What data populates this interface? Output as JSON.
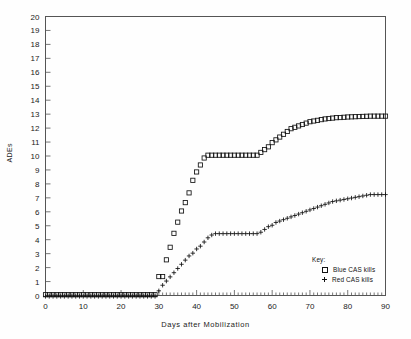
{
  "chart_data": {
    "type": "line",
    "title": "",
    "xlabel": "Days after Mobilization",
    "ylabel": "ADEs",
    "xlim": [
      0,
      90
    ],
    "ylim": [
      0,
      20
    ],
    "xticks": [
      0,
      10,
      20,
      30,
      40,
      50,
      60,
      70,
      80,
      90
    ],
    "yticks": [
      0,
      1,
      2,
      3,
      4,
      5,
      6,
      7,
      8,
      9,
      10,
      11,
      12,
      13,
      14,
      15,
      16,
      17,
      18,
      19,
      20
    ],
    "x_minor_tick_step": 1,
    "y_minor_tick_step": 1,
    "grid": false,
    "legend_position": "inside-lower-right",
    "legend_title": "Key:",
    "x": [
      0,
      1,
      2,
      3,
      4,
      5,
      6,
      7,
      8,
      9,
      10,
      11,
      12,
      13,
      14,
      15,
      16,
      17,
      18,
      19,
      20,
      21,
      22,
      23,
      24,
      25,
      26,
      27,
      28,
      29,
      30,
      31,
      32,
      33,
      34,
      35,
      36,
      37,
      38,
      39,
      40,
      41,
      42,
      43,
      44,
      45,
      46,
      47,
      48,
      49,
      50,
      51,
      52,
      53,
      54,
      55,
      56,
      57,
      58,
      59,
      60,
      61,
      62,
      63,
      64,
      65,
      66,
      67,
      68,
      69,
      70,
      71,
      72,
      73,
      74,
      75,
      76,
      77,
      78,
      79,
      80,
      81,
      82,
      83,
      84,
      85,
      86,
      87,
      88,
      89,
      90
    ],
    "series": [
      {
        "name": "Blue CAS kills",
        "marker": "square",
        "color": "#111111",
        "values": [
          0,
          0,
          0,
          0,
          0,
          0,
          0,
          0,
          0,
          0,
          0,
          0,
          0,
          0,
          0,
          0,
          0,
          0,
          0,
          0,
          0,
          0,
          0,
          0,
          0,
          0,
          0,
          0,
          0,
          0,
          1.3,
          1.3,
          2.5,
          3.4,
          4.4,
          5.2,
          6.0,
          6.6,
          7.3,
          8.2,
          8.8,
          9.3,
          9.8,
          10.0,
          10.0,
          10.0,
          10.0,
          10.0,
          10.0,
          10.0,
          10.0,
          10.0,
          10.0,
          10.0,
          10.0,
          10.0,
          10.0,
          10.2,
          10.4,
          10.6,
          10.9,
          11.1,
          11.3,
          11.5,
          11.7,
          11.9,
          12.0,
          12.1,
          12.2,
          12.3,
          12.4,
          12.45,
          12.5,
          12.55,
          12.6,
          12.63,
          12.66,
          12.69,
          12.7,
          12.72,
          12.74,
          12.75,
          12.76,
          12.77,
          12.78,
          12.79,
          12.8,
          12.8,
          12.8,
          12.8,
          12.8
        ]
      },
      {
        "name": "Red CAS kills",
        "marker": "plus",
        "color": "#111111",
        "values": [
          0,
          0,
          0,
          0,
          0,
          0,
          0,
          0,
          0,
          0,
          0,
          0,
          0,
          0,
          0,
          0,
          0,
          0,
          0,
          0,
          0,
          0,
          0,
          0,
          0,
          0,
          0,
          0,
          0,
          0,
          0.4,
          0.8,
          1.1,
          1.4,
          1.7,
          2.0,
          2.3,
          2.6,
          2.9,
          3.1,
          3.4,
          3.6,
          3.9,
          4.2,
          4.4,
          4.5,
          4.5,
          4.5,
          4.5,
          4.5,
          4.5,
          4.5,
          4.5,
          4.5,
          4.5,
          4.5,
          4.5,
          4.6,
          4.8,
          5.0,
          5.1,
          5.3,
          5.4,
          5.5,
          5.6,
          5.7,
          5.8,
          5.9,
          6.0,
          6.1,
          6.2,
          6.3,
          6.4,
          6.5,
          6.6,
          6.7,
          6.8,
          6.85,
          6.9,
          6.95,
          7.0,
          7.05,
          7.1,
          7.15,
          7.2,
          7.25,
          7.3,
          7.3,
          7.3,
          7.3,
          7.3
        ]
      }
    ],
    "legend": [
      {
        "label": "Blue CAS kills",
        "marker": "square"
      },
      {
        "label": "Red CAS kills",
        "marker": "plus"
      }
    ]
  },
  "axis": {
    "x_tick_labels": [
      "0",
      "10",
      "20",
      "30",
      "40",
      "50",
      "60",
      "70",
      "80",
      "90"
    ],
    "y_tick_labels": [
      "20",
      "19",
      "18",
      "17",
      "16",
      "15",
      "14",
      "13",
      "12",
      "11",
      "10",
      "9",
      "8",
      "7",
      "6",
      "5",
      "4",
      "3",
      "2",
      "1",
      "0"
    ]
  },
  "colors": {
    "ink": "#111111",
    "frame": "#555555",
    "background": "#fefefe"
  }
}
